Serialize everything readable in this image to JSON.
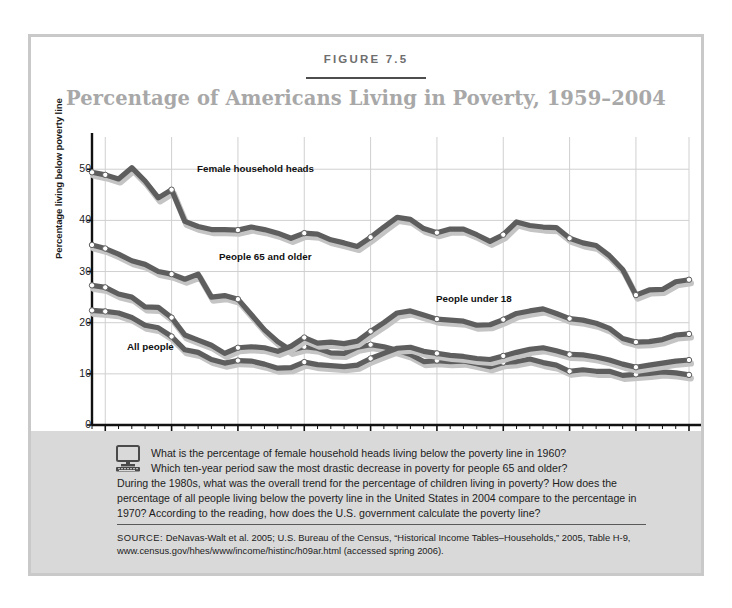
{
  "figure": {
    "label": "FIGURE 7.5",
    "title": "Percentage of Americans Living in Poverty, 1959–2004"
  },
  "annotations": {
    "female": "Female household heads",
    "elderly": "People 65 and older",
    "children": "People under 18",
    "all": "All people"
  },
  "question": {
    "icon": "computer-monitor-icon",
    "line1": "What is the percentage of female household heads living below the poverty line in 1960?",
    "line2": "Which ten-year period saw the most drastic decrease in poverty for people 65 and older?",
    "rest": "During the 1980s, what was the overall trend for the percentage of children living in poverty? How does the percentage of all people living below the poverty line in the United States in 2004 compare to the percentage in 1970? According to the reading, how does the U.S. government calculate the poverty line?"
  },
  "source": {
    "keyword": "SOURCE:",
    "text": "DeNavas-Walt et al. 2005; U.S. Bureau of the Census, “Historical Income Tables–Households,” 2005, Table H-9, www.census.gov/hhes/www/income/histinc/h09ar.html (accessed spring 2006)."
  },
  "colors": {
    "line_dark": "#5e5e5e",
    "line_shadow": "#c4c4c4",
    "marker_fill": "#ffffff",
    "grid": "#d0d0d0",
    "axis": "#111111",
    "panel_bg": "#d9d9d9",
    "border": "#c9c9c9",
    "title": "#a8a8a8"
  },
  "chart_data": {
    "type": "line",
    "title": "Percentage of Americans Living in Poverty, 1959–2004",
    "xlabel": "",
    "ylabel": "Percentage living below poverty line",
    "xlim": [
      1959,
      2004
    ],
    "ylim": [
      0,
      52
    ],
    "yticks": [
      0,
      10,
      20,
      30,
      40,
      50
    ],
    "xticks": [
      1960,
      1965,
      1970,
      1975,
      1980,
      1985,
      1990,
      1995,
      2000,
      2004
    ],
    "xtick_labels": [
      "1960",
      "1965",
      "1970",
      "1975",
      "1980",
      "1985",
      "1990",
      "1995",
      "2000",
      "2004"
    ],
    "grid": true,
    "legend": "inline annotations",
    "x": [
      1959,
      1960,
      1961,
      1962,
      1963,
      1964,
      1965,
      1966,
      1967,
      1968,
      1969,
      1970,
      1971,
      1972,
      1973,
      1974,
      1975,
      1976,
      1977,
      1978,
      1979,
      1980,
      1981,
      1982,
      1983,
      1984,
      1985,
      1986,
      1987,
      1988,
      1989,
      1990,
      1991,
      1992,
      1993,
      1994,
      1995,
      1996,
      1997,
      1998,
      1999,
      2000,
      2001,
      2002,
      2003,
      2004
    ],
    "series": [
      {
        "name": "Female household heads",
        "marker_years": [
          1959,
          1960,
          1965,
          1970,
          1975,
          1980,
          1985,
          1990,
          1995,
          2000,
          2004
        ],
        "values": [
          49.4,
          48.9,
          48.1,
          50.3,
          47.7,
          44.4,
          46.0,
          39.8,
          38.8,
          38.2,
          38.2,
          38.1,
          38.7,
          38.2,
          37.5,
          36.5,
          37.5,
          37.3,
          36.2,
          35.6,
          34.9,
          36.7,
          38.7,
          40.6,
          40.2,
          38.4,
          37.6,
          38.3,
          38.3,
          37.2,
          35.9,
          37.2,
          39.7,
          39.0,
          38.7,
          38.6,
          36.5,
          35.6,
          35.1,
          33.1,
          30.4,
          25.4,
          26.4,
          26.5,
          28.0,
          28.4
        ]
      },
      {
        "name": "People 65 and older",
        "marker_years": [
          1959,
          1960,
          1965,
          1970,
          1975,
          1980,
          1985,
          1990,
          1995,
          2000,
          2004
        ],
        "values": [
          35.2,
          34.5,
          33.4,
          32.1,
          31.4,
          30.0,
          29.5,
          28.5,
          29.5,
          25.0,
          25.3,
          24.6,
          21.6,
          18.6,
          16.3,
          14.6,
          15.3,
          15.0,
          14.1,
          14.0,
          15.2,
          15.7,
          15.3,
          14.6,
          13.8,
          12.4,
          12.6,
          12.4,
          12.5,
          12.0,
          11.4,
          12.2,
          12.4,
          12.9,
          12.2,
          11.7,
          10.5,
          10.8,
          10.5,
          10.5,
          9.7,
          9.9,
          10.1,
          10.4,
          10.2,
          9.8
        ]
      },
      {
        "name": "People under 18",
        "marker_years": [
          1959,
          1960,
          1965,
          1970,
          1975,
          1980,
          1985,
          1990,
          1995,
          2000,
          2004
        ],
        "values": [
          27.3,
          26.9,
          25.6,
          25.0,
          23.1,
          23.0,
          21.0,
          17.6,
          16.6,
          15.6,
          14.0,
          15.1,
          15.3,
          15.1,
          14.4,
          15.4,
          17.1,
          16.0,
          16.2,
          15.9,
          16.4,
          18.3,
          20.0,
          21.9,
          22.3,
          21.5,
          20.7,
          20.5,
          20.3,
          19.5,
          19.6,
          20.6,
          21.8,
          22.3,
          22.7,
          21.8,
          20.8,
          20.5,
          19.9,
          18.9,
          16.9,
          16.2,
          16.3,
          16.7,
          17.6,
          17.8
        ]
      },
      {
        "name": "All people",
        "marker_years": [
          1959,
          1960,
          1965,
          1970,
          1975,
          1980,
          1985,
          1990,
          1995,
          2000,
          2004
        ],
        "values": [
          22.4,
          22.2,
          21.9,
          21.0,
          19.5,
          19.0,
          17.3,
          14.7,
          14.2,
          12.8,
          12.1,
          12.6,
          12.5,
          11.9,
          11.1,
          11.2,
          12.3,
          11.8,
          11.6,
          11.4,
          11.7,
          13.0,
          14.0,
          15.0,
          15.2,
          14.4,
          14.0,
          13.6,
          13.4,
          13.0,
          12.8,
          13.5,
          14.2,
          14.8,
          15.1,
          14.5,
          13.8,
          13.7,
          13.3,
          12.7,
          11.9,
          11.3,
          11.7,
          12.1,
          12.5,
          12.7
        ]
      }
    ]
  }
}
